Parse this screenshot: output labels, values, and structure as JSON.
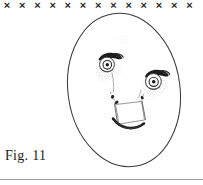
{
  "figure": {
    "caption": "Fig. 11",
    "colors": {
      "background": "#ffffff",
      "ink": "#2b2b2b",
      "ink_dark": "#111111",
      "ink_light": "#6e6e6e",
      "rule": "#9a9a9a",
      "stipple": "#555555"
    }
  },
  "top_mark_row": {
    "glyph": "×",
    "name": "x-mark",
    "count": 13,
    "start_x": 7,
    "spacing": 15.2,
    "y": 9,
    "font_size": 11,
    "labels": [
      "×",
      "×",
      "×",
      "×",
      "×",
      "×",
      "×",
      "×",
      "×",
      "×",
      "×",
      "×",
      "×"
    ]
  },
  "face": {
    "outline": {
      "name": "face-oval",
      "cx": 124,
      "cy": 90,
      "rx": 56,
      "ry": 77,
      "rotation": -8
    },
    "left_eye": {
      "name": "left-eye",
      "cx": 107,
      "cy": 64,
      "r_outer": 7.5,
      "r_iris": 4.2,
      "r_pupil": 1.8,
      "lash_rotation": -22
    },
    "right_eye": {
      "name": "right-eye",
      "cx": 153,
      "cy": 81,
      "r_outer": 8.0,
      "r_iris": 4.5,
      "r_pupil": 1.9,
      "lash_rotation": -20
    },
    "nose": {
      "name": "nose-dotted-arc",
      "style": "stippled arc with bead marks"
    },
    "mouth": {
      "name": "mouth-trapezoid",
      "style": "trapezoid with dark lower lip curve"
    }
  },
  "bottom_rule": {
    "name": "bottom-rule",
    "y": 179,
    "thickness": 1
  }
}
